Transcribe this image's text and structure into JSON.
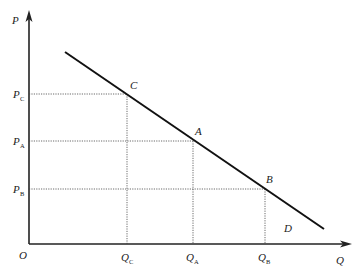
{
  "diagram": {
    "type": "demand-curve",
    "axes": {
      "y_label": "P",
      "x_label": "Q",
      "origin_label": "O"
    },
    "points": [
      {
        "name": "C",
        "price_label": "P",
        "price_sub": "C",
        "qty_label": "Q",
        "qty_sub": "C"
      },
      {
        "name": "A",
        "price_label": "P",
        "price_sub": "A",
        "qty_label": "Q",
        "qty_sub": "A"
      },
      {
        "name": "B",
        "price_label": "P",
        "price_sub": "B",
        "qty_label": "Q",
        "qty_sub": "B"
      }
    ],
    "region_label": "D",
    "colors": {
      "line": "#111111",
      "axis": "#222222",
      "guide": "#444444"
    }
  }
}
